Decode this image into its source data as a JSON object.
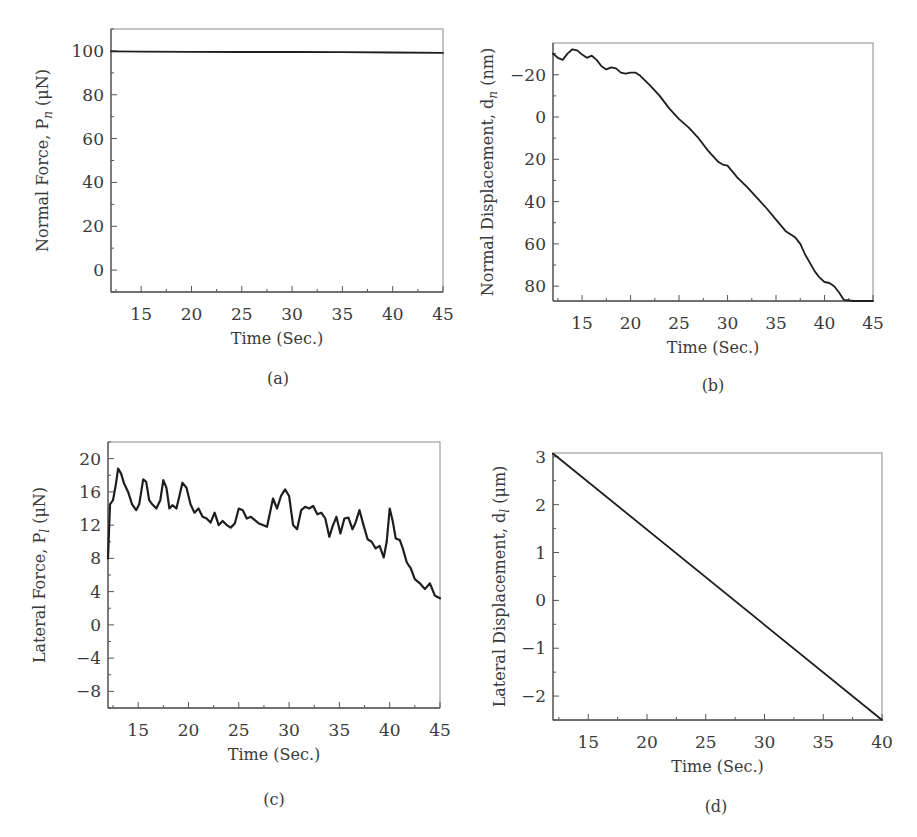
{
  "chart_data": [
    {
      "id": "a",
      "type": "line",
      "panel_label": "(a)",
      "title": "",
      "xlabel": "Time (Sec.)",
      "ylabel": "Normal Force, P_n (μN)",
      "ylabel_parts": {
        "main": "Normal Force, P",
        "sub": "n",
        "unit": " (μN)"
      },
      "xlim": [
        12,
        45
      ],
      "ylim": [
        -10,
        110
      ],
      "y_inverted": false,
      "xticks": [
        15,
        20,
        25,
        30,
        35,
        40,
        45
      ],
      "yticks": [
        0,
        20,
        40,
        60,
        80,
        100
      ],
      "grid": false,
      "legend": null,
      "series": [
        {
          "name": "Normal Force",
          "x": [
            12,
            15,
            20,
            25,
            30,
            35,
            40,
            45
          ],
          "y": [
            99.8,
            99.7,
            99.6,
            99.5,
            99.5,
            99.4,
            99.3,
            99.1
          ]
        }
      ]
    },
    {
      "id": "b",
      "type": "line",
      "panel_label": "(b)",
      "title": "",
      "xlabel": "Time (Sec.)",
      "ylabel": "Normal Displacement, d_n (nm)",
      "ylabel_parts": {
        "main": "Normal Displacement, d",
        "sub": "n",
        "unit": " (nm)"
      },
      "xlim": [
        12,
        45
      ],
      "ylim": [
        -35,
        87
      ],
      "y_inverted": true,
      "xticks": [
        15,
        20,
        25,
        30,
        35,
        40,
        45
      ],
      "yticks": [
        -20,
        0,
        20,
        40,
        60,
        80
      ],
      "grid": false,
      "legend": null,
      "series": [
        {
          "name": "Normal Displacement",
          "x": [
            12,
            12.5,
            13,
            13.5,
            14,
            14.5,
            15,
            15.5,
            16,
            16.5,
            17,
            17.5,
            18,
            18.5,
            19,
            19.5,
            20,
            20.5,
            21,
            22,
            23,
            24,
            25,
            26,
            27,
            28,
            29,
            29.5,
            30,
            31,
            32,
            33,
            34,
            35,
            36,
            37,
            37.5,
            38,
            39,
            39.5,
            40,
            40.5,
            41,
            41.5,
            42,
            43,
            44,
            45
          ],
          "y": [
            -30,
            -28,
            -27,
            -30,
            -32,
            -31.5,
            -29.5,
            -28,
            -29,
            -27,
            -24,
            -22.5,
            -23.5,
            -23,
            -21,
            -20.5,
            -21,
            -21,
            -19.5,
            -15,
            -10,
            -4,
            1,
            5,
            10,
            16,
            21,
            22.5,
            23,
            28.5,
            33,
            38,
            43,
            48.5,
            54,
            57,
            60,
            65,
            73,
            76,
            78,
            78.5,
            80,
            83,
            86.5,
            87,
            87,
            87
          ]
        }
      ]
    },
    {
      "id": "c",
      "type": "line",
      "panel_label": "(c)",
      "title": "",
      "xlabel": "Time (Sec.)",
      "ylabel": "Lateral Force, P_l (μN)",
      "ylabel_parts": {
        "main": "Lateral Force, P",
        "sub": "l",
        "unit": " (μN)"
      },
      "xlim": [
        12,
        45
      ],
      "ylim": [
        -10,
        22
      ],
      "y_inverted": false,
      "xticks": [
        15,
        20,
        25,
        30,
        35,
        40,
        45
      ],
      "yticks": [
        -8,
        -4,
        0,
        4,
        8,
        12,
        16,
        20
      ],
      "grid": false,
      "legend": null,
      "series": [
        {
          "name": "Lateral Force",
          "x": [
            12,
            12.2,
            12.5,
            12.8,
            13,
            13.3,
            13.6,
            14,
            14.4,
            14.8,
            15.1,
            15.5,
            15.8,
            16.1,
            16.4,
            16.8,
            17.2,
            17.5,
            17.8,
            18.1,
            18.4,
            18.8,
            19.1,
            19.4,
            19.8,
            20.2,
            20.6,
            21,
            21.4,
            21.8,
            22.2,
            22.6,
            23,
            23.4,
            23.8,
            24.2,
            24.6,
            25,
            25.4,
            25.8,
            26.2,
            26.6,
            27,
            27.4,
            27.8,
            28.1,
            28.4,
            28.8,
            29.2,
            29.6,
            30,
            30.4,
            30.8,
            31.2,
            31.6,
            32,
            32.4,
            32.8,
            33.2,
            33.6,
            34,
            34.3,
            34.7,
            35.1,
            35.5,
            35.9,
            36.3,
            36.6,
            37,
            37.4,
            37.8,
            38.2,
            38.6,
            39,
            39.4,
            39.7,
            40,
            40.3,
            40.6,
            41,
            41.3,
            41.7,
            42.1,
            42.5,
            43,
            43.5,
            44,
            44.5,
            45
          ],
          "y": [
            8,
            14.5,
            15,
            17,
            18.8,
            18.2,
            17,
            16,
            14.5,
            13.8,
            14.5,
            17.5,
            17.2,
            15,
            14.5,
            14,
            15,
            17.4,
            16.5,
            14,
            14.4,
            14,
            15.5,
            17.1,
            16.5,
            14.5,
            13.5,
            14,
            13,
            12.8,
            12.3,
            13.5,
            12,
            12.5,
            12,
            11.7,
            12.2,
            14,
            13.8,
            12.8,
            13,
            12.6,
            12.2,
            12,
            11.8,
            13.5,
            15.2,
            14,
            15.5,
            16.3,
            15.5,
            12,
            11.5,
            13.8,
            14.2,
            14,
            14.3,
            13.3,
            13.5,
            12.8,
            10.6,
            11.8,
            13,
            11,
            12.8,
            12.9,
            11.5,
            12.3,
            13.8,
            12,
            10.3,
            10,
            9.2,
            9.5,
            8.1,
            10,
            14,
            12.5,
            10.4,
            10.2,
            9.2,
            7.5,
            6.8,
            5.5,
            5,
            4.3,
            5,
            3.5,
            3.2
          ]
        }
      ]
    },
    {
      "id": "d",
      "type": "line",
      "panel_label": "(d)",
      "title": "",
      "xlabel": "Time (Sec.)",
      "ylabel": "Lateral Displacement, d_l (μm)",
      "ylabel_parts": {
        "main": "Lateral Displacement, d",
        "sub": "l",
        "unit": " (μm)"
      },
      "xlim": [
        12,
        40
      ],
      "ylim": [
        -2.5,
        3.08
      ],
      "y_inverted": false,
      "xticks": [
        15,
        20,
        25,
        30,
        35,
        40
      ],
      "yticks": [
        -2,
        -1,
        0,
        1,
        2,
        3
      ],
      "grid": false,
      "legend": null,
      "series": [
        {
          "name": "Lateral Displacement",
          "x": [
            12,
            40
          ],
          "y": [
            3.07,
            -2.5
          ]
        }
      ]
    }
  ],
  "layout": {
    "panels": [
      {
        "id": "a",
        "box": {
          "left": 111,
          "top": 29,
          "right": 443,
          "bottom": 292
        },
        "label_pos": {
          "x": 278,
          "y": 384
        }
      },
      {
        "id": "b",
        "box": {
          "left": 553,
          "top": 43,
          "right": 873,
          "bottom": 301
        },
        "label_pos": {
          "x": 713,
          "y": 391
        }
      },
      {
        "id": "c",
        "box": {
          "left": 108,
          "top": 442,
          "right": 440,
          "bottom": 708
        },
        "label_pos": {
          "x": 274,
          "y": 805
        }
      },
      {
        "id": "d",
        "box": {
          "left": 553,
          "top": 453,
          "right": 882,
          "bottom": 720
        },
        "label_pos": {
          "x": 716,
          "y": 812
        }
      }
    ],
    "line_color": "#1e1e1e",
    "axis_color": "#555555"
  }
}
